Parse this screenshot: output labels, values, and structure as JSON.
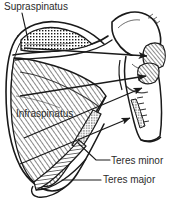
{
  "figure": {
    "background_color": "#ffffff",
    "ink_color": "#1a1a1a",
    "width": 172,
    "height": 207
  },
  "labels": {
    "supraspinatus": "Supraspinatus",
    "infraspinatus": "Infraspinatus",
    "teres_minor": "Teres minor",
    "teres_major": "Teres major"
  },
  "regions": [
    {
      "name": "supraspinatus-fossa",
      "label": "Supraspinatus",
      "fill_pattern": "stipple-dots",
      "position": "upper-medial scapula above the spine"
    },
    {
      "name": "infraspinatus-fossa",
      "label": "Infraspinatus",
      "fill_pattern": "diagonal-hatch",
      "position": "large area below the scapular spine"
    },
    {
      "name": "teres-minor-origin",
      "label": "Teres minor",
      "fill_pattern": "stipple-dots",
      "position": "upper lateral border of scapula"
    },
    {
      "name": "teres-major-origin",
      "label": "Teres major",
      "fill_pattern": "horizontal-hatch",
      "position": "inferior angle / lower lateral border of scapula"
    },
    {
      "name": "greater-tubercle-insertion",
      "label": "",
      "fill_pattern": "diagonal-hatch",
      "position": "greater tubercle of humerus"
    },
    {
      "name": "humerus-shaft-insertion",
      "label": "",
      "fill_pattern": "stipple-dots",
      "position": "proximal humeral shaft"
    }
  ],
  "leaders": [
    {
      "name": "supraspinatus-leader",
      "from": "Supraspinatus",
      "to": "supraspinatus-fossa",
      "style": "line"
    },
    {
      "name": "teres-minor-leader",
      "from": "Teres minor",
      "to": "teres-minor-origin",
      "style": "line"
    },
    {
      "name": "teres-major-leader",
      "from": "Teres major",
      "to": "teres-major-origin",
      "style": "line"
    }
  ],
  "arrows": [
    {
      "name": "supraspinatus-action-arrow",
      "direction": "right",
      "meaning": "origin to insertion on greater tubercle"
    },
    {
      "name": "infraspinatus-action-arrow",
      "direction": "right",
      "meaning": "origin to insertion on greater tubercle"
    },
    {
      "name": "teres-minor-action-arrow",
      "direction": "right",
      "meaning": "origin to insertion on greater tubercle"
    },
    {
      "name": "teres-major-action-arrow",
      "direction": "right",
      "meaning": "origin to insertion on humeral shaft"
    }
  ]
}
